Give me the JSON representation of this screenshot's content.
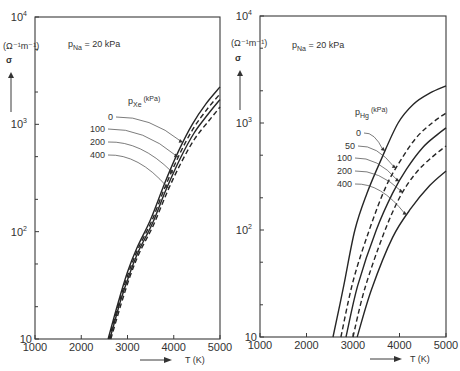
{
  "chart_data": [
    {
      "type": "line",
      "panel": "left",
      "annotation": {
        "symbol": "p",
        "subscript": "Na",
        "text": " = 20 kPa"
      },
      "legend_title": {
        "symbol": "p",
        "subscript": "Xe",
        "unit": "(kPa)"
      },
      "xlabel": "T  (K)",
      "ylabel": "σ",
      "yunit": "(Ω⁻¹m⁻¹)",
      "xlim": [
        1000,
        5000
      ],
      "ylim": [
        10,
        10000
      ],
      "yscale": "log",
      "xticks": [
        1000,
        2000,
        3000,
        4000,
        5000
      ],
      "xtick_labels": [
        "1000",
        "2000",
        "3000",
        "4000",
        "5000"
      ],
      "yticks": [
        10,
        100,
        1000,
        10000
      ],
      "ytick_labels": [
        {
          "base": "10",
          "exp": ""
        },
        {
          "base": "10",
          "exp": "2"
        },
        {
          "base": "10",
          "exp": "3"
        },
        {
          "base": "10",
          "exp": "4"
        }
      ],
      "series": [
        {
          "name": "0",
          "style": "solid",
          "x": [
            2580,
            2800,
            3000,
            3200,
            3500,
            3800,
            4100,
            4400,
            4700,
            5000
          ],
          "y": [
            10,
            22,
            42,
            70,
            130,
            280,
            560,
            1000,
            1560,
            2230
          ]
        },
        {
          "name": "100",
          "style": "dashed",
          "x": [
            2600,
            2820,
            3020,
            3220,
            3520,
            3820,
            4120,
            4420,
            4720,
            5000
          ],
          "y": [
            10,
            22,
            41,
            68,
            125,
            265,
            520,
            910,
            1380,
            1920
          ]
        },
        {
          "name": "200",
          "style": "solid",
          "x": [
            2620,
            2840,
            3040,
            3240,
            3540,
            3840,
            4140,
            4440,
            4740,
            5000
          ],
          "y": [
            10,
            22,
            40,
            66,
            120,
            250,
            480,
            830,
            1240,
            1700
          ]
        },
        {
          "name": "400",
          "style": "dashed",
          "x": [
            2640,
            2860,
            3060,
            3260,
            3560,
            3860,
            4160,
            4460,
            4760,
            5000
          ],
          "y": [
            10,
            21,
            39,
            64,
            115,
            235,
            440,
            740,
            1080,
            1450
          ]
        }
      ]
    },
    {
      "type": "line",
      "panel": "right",
      "annotation": {
        "symbol": "p",
        "subscript": "Na",
        "text": " = 20 kPa"
      },
      "legend_title": {
        "symbol": "p",
        "subscript": "Hg",
        "unit": "(kPa)"
      },
      "xlabel": "T  (K)",
      "ylabel": "σ",
      "yunit": "(Ω⁻¹m⁻¹)",
      "xlim": [
        1000,
        5000
      ],
      "ylim": [
        10,
        10000
      ],
      "yscale": "log",
      "xticks": [
        1000,
        2000,
        3000,
        4000,
        5000
      ],
      "xtick_labels": [
        "1000",
        "2000",
        "3000",
        "4000",
        "5000"
      ],
      "yticks": [
        10,
        100,
        1000,
        10000
      ],
      "ytick_labels": [
        {
          "base": "10",
          "exp": ""
        },
        {
          "base": "10",
          "exp": "2"
        },
        {
          "base": "10",
          "exp": "3"
        },
        {
          "base": "10",
          "exp": "4"
        }
      ],
      "series": [
        {
          "name": "0",
          "style": "solid",
          "x": [
            2570,
            2800,
            3040,
            3300,
            3600,
            3970,
            4300,
            4650,
            5000
          ],
          "y": [
            10,
            30,
            100,
            220,
            450,
            1000,
            1500,
            1900,
            2220
          ]
        },
        {
          "name": "50",
          "style": "dashed",
          "x": [
            2740,
            3000,
            3350,
            3700,
            4000,
            4350,
            4700,
            5000
          ],
          "y": [
            10,
            33,
            100,
            250,
            430,
            720,
            1000,
            1240
          ]
        },
        {
          "name": "100",
          "style": "solid",
          "x": [
            2850,
            3100,
            3500,
            3850,
            4150,
            4500,
            4800,
            5000
          ],
          "y": [
            10,
            30,
            100,
            220,
            370,
            590,
            770,
            900
          ]
        },
        {
          "name": "200",
          "style": "dashed",
          "x": [
            3000,
            3250,
            3650,
            4000,
            4350,
            4700,
            5000
          ],
          "y": [
            10,
            28,
            90,
            200,
            340,
            480,
            610
          ]
        },
        {
          "name": "400",
          "style": "solid",
          "x": [
            3090,
            3400,
            3850,
            4250,
            4650,
            5000
          ],
          "y": [
            10,
            28,
            85,
            160,
            260,
            356
          ]
        }
      ]
    }
  ]
}
